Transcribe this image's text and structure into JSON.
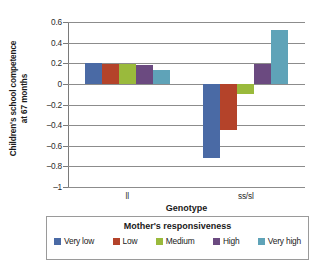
{
  "chart_data": {
    "type": "bar",
    "title": "",
    "xlabel": "Genotype",
    "ylabel": "Children's school competence at 67 months",
    "ylabel_line1": "Children's school competence",
    "ylabel_line2": "at 67 months",
    "categories": [
      "ll",
      "ss/sl"
    ],
    "ylim": [
      -1,
      0.6
    ],
    "yticks": [
      0.6,
      0.4,
      0.2,
      0,
      -0.2,
      -0.4,
      -0.6,
      -0.8,
      -1
    ],
    "ytick_labels": [
      "0.6",
      "0.4",
      "0.2",
      "0",
      "–0.2",
      "–0.4",
      "–0.6",
      "–0.8",
      "–1"
    ],
    "grid": true,
    "legend_position": "bottom",
    "legend_title": "Mother's responsiveness",
    "series": [
      {
        "name": "Very low",
        "color": "#4a6aa5",
        "values": [
          0.2,
          -0.72
        ]
      },
      {
        "name": "Low",
        "color": "#b4432a",
        "values": [
          0.195,
          -0.45
        ]
      },
      {
        "name": "Medium",
        "color": "#9aba3c",
        "values": [
          0.19,
          -0.1
        ]
      },
      {
        "name": "High",
        "color": "#6b4a80",
        "values": [
          0.18,
          0.19
        ]
      },
      {
        "name": "Very high",
        "color": "#5fa3b8",
        "values": [
          0.13,
          0.52
        ]
      }
    ]
  }
}
